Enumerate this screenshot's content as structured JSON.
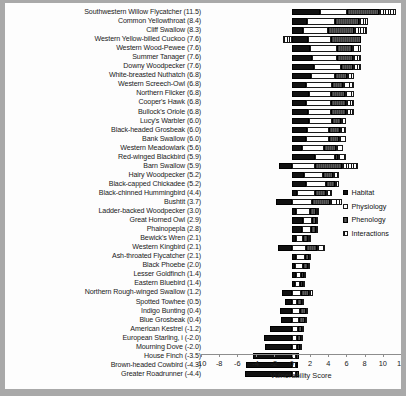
{
  "chart_data": {
    "type": "bar",
    "orientation": "horizontal",
    "stacked": true,
    "title": "",
    "xlabel": "Vulnerability Score",
    "ylabel": "",
    "xlim": [
      -10,
      12
    ],
    "xticks": [
      -10,
      -8,
      -6,
      -4,
      -2,
      0,
      2,
      4,
      6,
      8,
      10,
      12
    ],
    "grid": false,
    "legend_position": "right",
    "series": [
      {
        "name": "Habitat",
        "color": "#111111",
        "pattern": "solid-black"
      },
      {
        "name": "Physiology",
        "color": "#ffffff",
        "pattern": "open-white"
      },
      {
        "name": "Phenology",
        "color": "#4a4a4a",
        "pattern": "dark-hatch"
      },
      {
        "name": "Interactions",
        "color": "#ffffff",
        "pattern": "vertical-lines"
      }
    ],
    "categories": [
      "Southwestern Willow Flycatcher",
      "Common Yellowthroat",
      "Cliff Swallow",
      "Western Yellow-billed Cuckoo",
      "Western Wood-Pewee",
      "Summer Tanager",
      "Downy Woodpecker",
      "White-breasted Nuthatch",
      "Western Screech-Owl",
      "Northern Flicker",
      "Cooper's Hawk",
      "Bullock's Oriole",
      "Lucy's Warbler",
      "Black-headed Grosbeak",
      "Bank Swallow",
      "Western Meadowlark",
      "Red-winged Blackbird",
      "Barn Swallow",
      "Hairy Woodpecker",
      "Black-capped Chickadee",
      "Black-chinned Hummingbird",
      "Bushtit",
      "Ladder-backed Woodpecker",
      "Great Horned Owl",
      "Phainopepla",
      "Bewick's Wren",
      "Western Kingbird",
      "Ash-throated Flycatcher",
      "Black Phoebe",
      "Lesser Goldfinch",
      "Eastern Bluebird",
      "Northern Rough-winged Swallow",
      "Spotted Towhee",
      "Indigo Bunting",
      "Blue Grosbeak",
      "American Kestrel",
      "European Starling, i",
      "Mourning Dove",
      "House Finch",
      "Brown-headed Cowbird",
      "Greater Roadrunner"
    ],
    "totals": [
      11.5,
      8.4,
      8.3,
      7.6,
      7.6,
      7.6,
      7.6,
      6.8,
      6.8,
      6.8,
      6.8,
      6.8,
      6.0,
      6.0,
      6.0,
      5.6,
      5.9,
      5.9,
      5.2,
      5.2,
      4.4,
      3.7,
      3.0,
      2.9,
      2.8,
      2.1,
      2.1,
      2.1,
      2.0,
      1.4,
      1.4,
      1.2,
      0.5,
      0.4,
      0.4,
      -1.2,
      -2.0,
      -2.0,
      -3.5,
      -4.3,
      -4.4
    ],
    "rows": [
      {
        "label": "Southwestern Willow Flycatcher",
        "value": 11.5,
        "habitat": 3.1,
        "physiology": 3.0,
        "phenology": 3.5,
        "interactions": 1.9
      },
      {
        "label": "Common Yellowthroat",
        "value": 8.4,
        "habitat": 1.7,
        "physiology": 3.0,
        "phenology": 2.7,
        "interactions": 1.0
      },
      {
        "label": "Cliff Swallow",
        "value": 8.3,
        "habitat": 1.2,
        "physiology": 2.8,
        "phenology": 2.8,
        "interactions": 1.5
      },
      {
        "label": "Western Yellow-billed Cuckoo",
        "value": 7.6,
        "habitat": 1.8,
        "physiology": 2.5,
        "phenology": 3.3,
        "interactions": -1.0
      },
      {
        "label": "Western Wood-Pewee",
        "value": 7.6,
        "habitat": 2.0,
        "physiology": 3.0,
        "phenology": 1.6,
        "interactions": 1.0
      },
      {
        "label": "Summer Tanager",
        "value": 7.6,
        "habitat": 2.2,
        "physiology": 2.8,
        "phenology": 1.7,
        "interactions": 0.9
      },
      {
        "label": "Downy Woodpecker",
        "value": 7.6,
        "habitat": 2.4,
        "physiology": 3.0,
        "phenology": 1.3,
        "interactions": 0.9
      },
      {
        "label": "White-breasted Nuthatch",
        "value": 6.8,
        "habitat": 2.1,
        "physiology": 2.6,
        "phenology": 1.4,
        "interactions": 0.7
      },
      {
        "label": "Western Screech-Owl",
        "value": 6.8,
        "habitat": 1.5,
        "physiology": 2.9,
        "phenology": 1.2,
        "interactions": 1.2
      },
      {
        "label": "Northern Flicker",
        "value": 6.8,
        "habitat": 1.9,
        "physiology": 2.4,
        "phenology": 1.5,
        "interactions": 1.0
      },
      {
        "label": "Cooper's Hawk",
        "value": 6.8,
        "habitat": 1.6,
        "physiology": 2.7,
        "phenology": 1.6,
        "interactions": 0.9
      },
      {
        "label": "Bullock's Oriole",
        "value": 6.8,
        "habitat": 1.8,
        "physiology": 2.5,
        "phenology": 1.6,
        "interactions": 0.9
      },
      {
        "label": "Lucy's Warbler",
        "value": 6.0,
        "habitat": 1.9,
        "physiology": 2.5,
        "phenology": 1.0,
        "interactions": 0.6
      },
      {
        "label": "Black-headed Grosbeak",
        "value": 6.0,
        "habitat": 1.7,
        "physiology": 2.4,
        "phenology": 1.2,
        "interactions": 0.7
      },
      {
        "label": "Bank Swallow",
        "value": 6.0,
        "habitat": 1.5,
        "physiology": 2.6,
        "phenology": 1.1,
        "interactions": 0.8
      },
      {
        "label": "Western Meadowlark",
        "value": 5.6,
        "habitat": 1.1,
        "physiology": 2.4,
        "phenology": 1.3,
        "interactions": 0.8
      },
      {
        "label": "Red-winged Blackbird",
        "value": 5.9,
        "habitat": 2.5,
        "physiology": 2.2,
        "phenology": 0.4,
        "interactions": 0.8
      },
      {
        "label": "Barn Swallow",
        "value": 5.9,
        "habitat": -1.4,
        "physiology": 2.5,
        "phenology": 3.0,
        "interactions": 1.8
      },
      {
        "label": "Hairy Woodpecker",
        "value": 5.2,
        "habitat": 1.3,
        "physiology": 2.1,
        "phenology": 1.1,
        "interactions": 0.7
      },
      {
        "label": "Black-capped Chickadee",
        "value": 5.2,
        "habitat": 1.6,
        "physiology": 2.1,
        "phenology": 1.0,
        "interactions": 0.5
      },
      {
        "label": "Black-chinned Hummingbird",
        "value": 4.4,
        "habitat": 0.6,
        "physiology": 1.9,
        "phenology": 1.2,
        "interactions": 0.7
      },
      {
        "label": "Bushtit",
        "value": 3.7,
        "habitat": -1.8,
        "physiology": 2.2,
        "phenology": 2.0,
        "interactions": 1.3
      },
      {
        "label": "Ladder-backed Woodpecker",
        "value": 3.0,
        "habitat": 0.5,
        "physiology": 1.5,
        "phenology": 0.7,
        "interactions": 0.3
      },
      {
        "label": "Great Horned Owl",
        "value": 2.9,
        "habitat": 1.2,
        "physiology": 1.0,
        "phenology": 0.5,
        "interactions": 0.2
      },
      {
        "label": "Phainopepla",
        "value": 2.8,
        "habitat": 1.1,
        "physiology": 1.0,
        "phenology": 0.5,
        "interactions": 0.2
      },
      {
        "label": "Bewick's Wren",
        "value": 2.1,
        "habitat": 0.4,
        "physiology": 0.8,
        "phenology": 0.6,
        "interactions": 0.3
      },
      {
        "label": "Western Kingbird",
        "value": 2.1,
        "habitat": -1.5,
        "physiology": 1.6,
        "phenology": 1.2,
        "interactions": 0.8
      },
      {
        "label": "Ash-throated Flycatcher",
        "value": 2.1,
        "habitat": 0.5,
        "physiology": 0.9,
        "phenology": 0.5,
        "interactions": 0.2
      },
      {
        "label": "Black Phoebe",
        "value": 2.0,
        "habitat": 0.3,
        "physiology": 0.9,
        "phenology": 0.6,
        "interactions": 0.2
      },
      {
        "label": "Lesser Goldfinch",
        "value": 1.4,
        "habitat": 0.4,
        "physiology": 0.6,
        "phenology": 0.3,
        "interactions": 0.1
      },
      {
        "label": "Eastern Bluebird",
        "value": 1.4,
        "habitat": 0.3,
        "physiology": 0.6,
        "phenology": 0.3,
        "interactions": 0.2
      },
      {
        "label": "Northern Rough-winged Swallow",
        "value": 1.2,
        "habitat": -1.1,
        "physiology": 1.0,
        "phenology": 0.9,
        "interactions": 0.4
      },
      {
        "label": "Spotted Towhee",
        "value": 0.5,
        "habitat": -0.8,
        "physiology": 0.6,
        "phenology": 0.5,
        "interactions": 0.2
      },
      {
        "label": "Indigo Bunting",
        "value": 0.4,
        "habitat": -1.3,
        "physiology": 0.9,
        "phenology": 0.6,
        "interactions": 0.2
      },
      {
        "label": "Blue Grosbeak",
        "value": 0.4,
        "habitat": -1.2,
        "physiology": 0.8,
        "phenology": 0.6,
        "interactions": 0.2
      },
      {
        "label": "American Kestrel",
        "value": -1.2,
        "habitat": -2.4,
        "physiology": 0.7,
        "phenology": 0.4,
        "interactions": 0.1
      },
      {
        "label": "European Starling, i",
        "value": -2.0,
        "habitat": -3.1,
        "physiology": 0.6,
        "phenology": 0.4,
        "interactions": 0.1
      },
      {
        "label": "Mourning Dove",
        "value": -2.0,
        "habitat": -3.0,
        "physiology": 0.6,
        "phenology": 0.3,
        "interactions": 0.1
      },
      {
        "label": "House Finch",
        "value": -3.5,
        "habitat": -4.3,
        "physiology": 0.5,
        "phenology": 0.3,
        "interactions": 0.0
      },
      {
        "label": "Brown-headed Cowbird",
        "value": -4.3,
        "habitat": -5.0,
        "physiology": 0.4,
        "phenology": 0.3,
        "interactions": 0.0
      },
      {
        "label": "Greater Roadrunner",
        "value": -4.4,
        "habitat": -5.2,
        "physiology": 0.5,
        "phenology": 0.3,
        "interactions": 0.0
      }
    ]
  },
  "legend": {
    "items": [
      {
        "label": "Habitat"
      },
      {
        "label": "Physiology"
      },
      {
        "label": "Phenology"
      },
      {
        "label": "Interactions"
      }
    ]
  }
}
